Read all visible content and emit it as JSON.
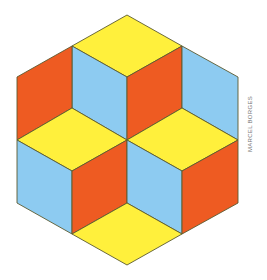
{
  "figure": {
    "credit": "MARCEL BORGES",
    "colors": {
      "yellow": "#FFF03C",
      "blue": "#8DCBF1",
      "red": "#EE5B22",
      "stroke": "#5B5A30"
    },
    "faces": [
      {
        "name": "top-cube-top",
        "color": "yellow",
        "points": "127,15 182,46 127,77 72,46"
      },
      {
        "name": "top-cube-left",
        "color": "blue",
        "points": "72,46 127,77 127,140 72,108"
      },
      {
        "name": "top-cube-right",
        "color": "red",
        "points": "127,77 182,46 182,108 127,140"
      },
      {
        "name": "upper-left-red",
        "color": "red",
        "points": "17,77 72,46 72,108 17,140"
      },
      {
        "name": "upper-right-blue",
        "color": "blue",
        "points": "182,46 238,77 238,140 182,108"
      },
      {
        "name": "left-cube-top",
        "color": "yellow",
        "points": "17,140 72,108 127,140 72,171"
      },
      {
        "name": "right-cube-top",
        "color": "yellow",
        "points": "127,140 182,108 238,140 182,171"
      },
      {
        "name": "left-cube-left",
        "color": "blue",
        "points": "17,140 72,171 72,234 17,203"
      },
      {
        "name": "left-cube-right",
        "color": "red",
        "points": "72,171 127,140 127,203 72,234"
      },
      {
        "name": "right-cube-left",
        "color": "blue",
        "points": "127,140 182,171 182,234 127,203"
      },
      {
        "name": "right-cube-right",
        "color": "red",
        "points": "182,171 238,140 238,203 182,234"
      },
      {
        "name": "bottom-yellow",
        "color": "yellow",
        "points": "72,234 127,203 182,234 127,265"
      }
    ]
  }
}
